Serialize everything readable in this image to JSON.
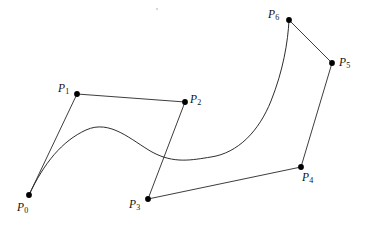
{
  "figure": {
    "kind": "bezier-control-polygon-diagram",
    "background_color": "#ffffff",
    "stroke_color": "#1a1a1a",
    "dot_color": "#000000",
    "width": 372,
    "height": 225
  },
  "chart_data": {
    "type": "scatter",
    "title": "",
    "subtitle": "",
    "xlabel": "",
    "ylabel": "",
    "grid": false,
    "legend": null,
    "axes_visible": false,
    "xlim": [
      0,
      372
    ],
    "ylim": [
      225,
      0
    ],
    "point_labels": [
      "P0",
      "P1",
      "P2",
      "P3",
      "P4",
      "P5",
      "P6"
    ],
    "x": [
      29,
      77,
      185,
      148,
      301,
      332,
      289
    ],
    "y": [
      195,
      94,
      102,
      199,
      167,
      63,
      20
    ],
    "points": [
      {
        "name": "P0",
        "letter": "P",
        "subscript": "0",
        "x": 29,
        "y": 195,
        "label_x": 17,
        "label_y": 202
      },
      {
        "name": "P1",
        "letter": "P",
        "subscript": "1",
        "x": 77,
        "y": 94,
        "label_x": 58,
        "label_y": 83
      },
      {
        "name": "P2",
        "letter": "P",
        "subscript": "2",
        "x": 185,
        "y": 102,
        "label_x": 190,
        "label_y": 94
      },
      {
        "name": "P3",
        "letter": "P",
        "subscript": "3",
        "x": 148,
        "y": 199,
        "label_x": 129,
        "label_y": 199
      },
      {
        "name": "P4",
        "letter": "P",
        "subscript": "4",
        "x": 301,
        "y": 167,
        "label_x": 302,
        "label_y": 172
      },
      {
        "name": "P5",
        "letter": "P",
        "subscript": "5",
        "x": 332,
        "y": 63,
        "label_x": 339,
        "label_y": 57
      },
      {
        "name": "P6",
        "letter": "P",
        "subscript": "6",
        "x": 289,
        "y": 20,
        "label_x": 268,
        "label_y": 9
      }
    ],
    "control_polygon_segments": [
      {
        "from": "P0",
        "to": "P1",
        "x1": 29,
        "y1": 195,
        "x2": 77,
        "y2": 94
      },
      {
        "from": "P1",
        "to": "P2",
        "x1": 77,
        "y1": 94,
        "x2": 185,
        "y2": 102
      },
      {
        "from": "P2",
        "to": "P3",
        "x1": 185,
        "y1": 102,
        "x2": 148,
        "y2": 199
      },
      {
        "from": "P3",
        "to": "P4",
        "x1": 148,
        "y1": 199,
        "x2": 301,
        "y2": 167
      },
      {
        "from": "P4",
        "to": "P5",
        "x1": 301,
        "y1": 167,
        "x2": 332,
        "y2": 63
      },
      {
        "from": "P5",
        "to": "P6",
        "x1": 332,
        "y1": 63,
        "x2": 289,
        "y2": 20
      }
    ],
    "curve_path": "M 29 195 C 44 163 62 141 86 130 C 110 119 131 140 152 152 C 174 164 192 160 211 157 C 238 153 259 131 271 101 C 283 71 288 42 289 20",
    "curve_features": {
      "start_point": "P0",
      "end_point": "P6",
      "hump_peak": {
        "x": 100,
        "y": 128
      },
      "trough": {
        "x": 205,
        "y": 158
      },
      "start_tangent_toward": "P1",
      "end_tangent_toward": "P5"
    },
    "speck": {
      "x": 156,
      "y": 8,
      "size": 2
    }
  }
}
